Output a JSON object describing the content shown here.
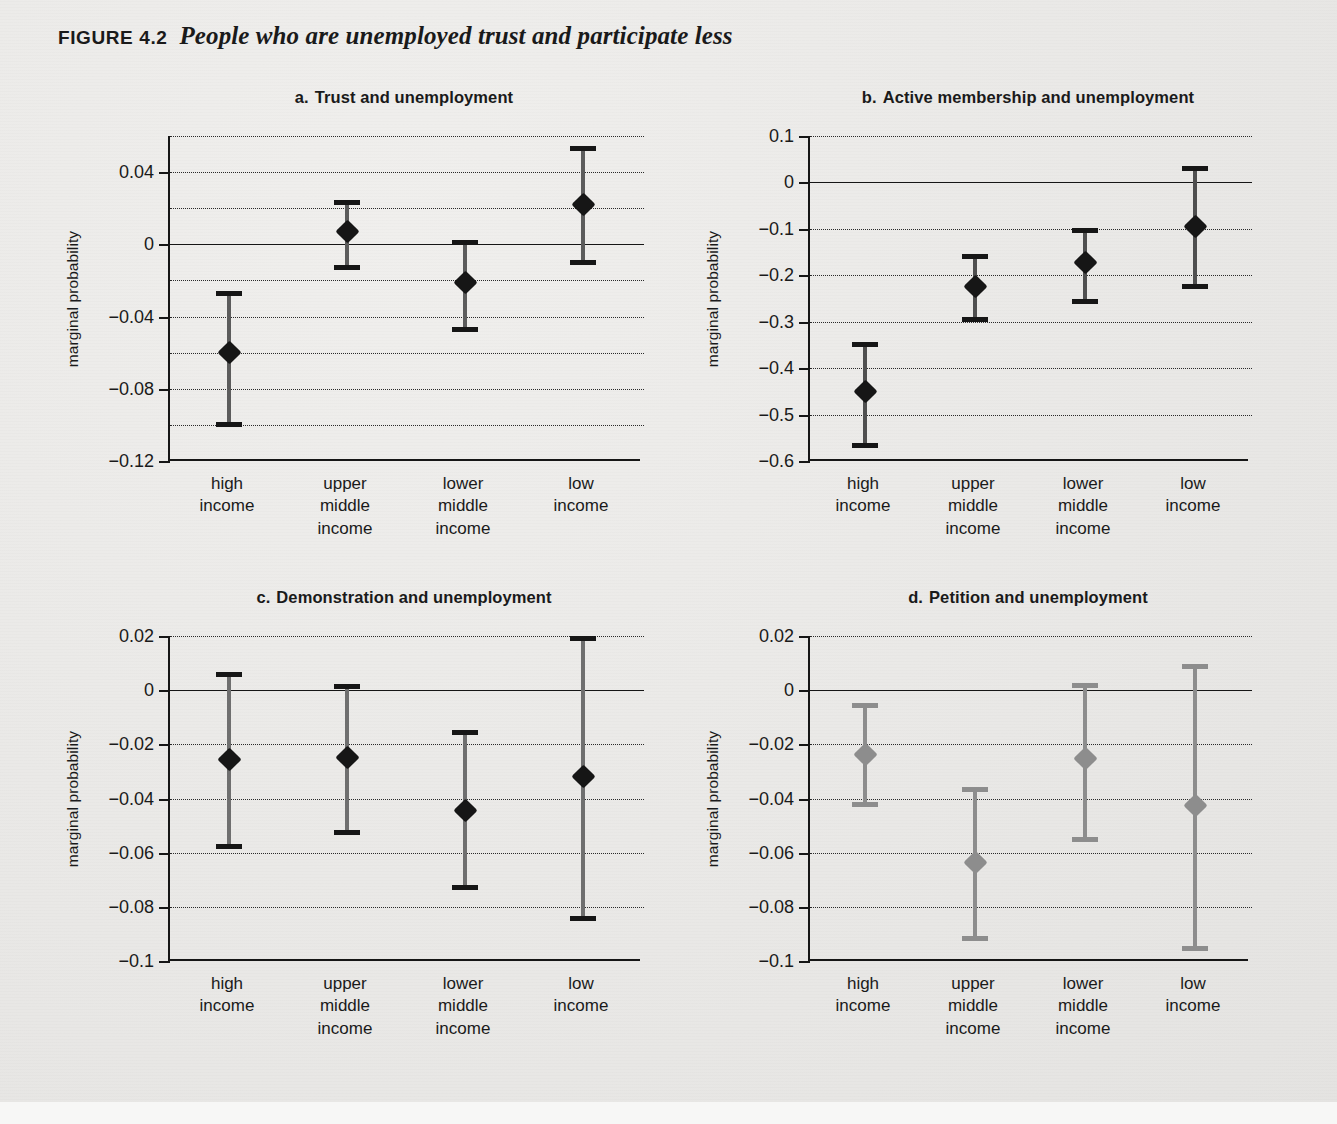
{
  "figure": {
    "label": "FIGURE 4.2",
    "title": "People who are unemployed trust and participate less"
  },
  "categories": [
    "high\nincome",
    "upper\nmiddle\nincome",
    "lower\nmiddle\nincome",
    "low\nincome"
  ],
  "category_labels": [
    [
      "high",
      "income"
    ],
    [
      "upper",
      "middle",
      "income"
    ],
    [
      "lower",
      "middle",
      "income"
    ],
    [
      "low",
      "income"
    ]
  ],
  "axis_label": "marginal probability",
  "colors": {
    "ink": "#161616",
    "panel_c_line": "#6f6f6f",
    "panel_d_line": "#8d8d8d",
    "background": "#ebebe9"
  },
  "chart_data": [
    {
      "type": "scatter",
      "panel": "a",
      "panel_letter": "a.",
      "title": "Trust and unemployment",
      "xlabel": "",
      "ylabel": "marginal probability",
      "ylim": [
        -0.12,
        0.06
      ],
      "yticks": [
        0.04,
        0,
        -0.04,
        -0.08,
        -0.12
      ],
      "ytick_labels": [
        "0.04",
        "0",
        "−0.04",
        "−0.08",
        "−0.12"
      ],
      "gridlines": [
        0.06,
        0.04,
        0.02,
        -0.02,
        -0.04,
        -0.06,
        -0.08,
        -0.1
      ],
      "grid": true,
      "zero_line": 0,
      "categories": [
        "high income",
        "upper middle income",
        "lower middle income",
        "low income"
      ],
      "values": [
        -0.06,
        0.007,
        -0.021,
        0.022
      ],
      "ci_low": [
        -0.1,
        -0.013,
        -0.047,
        -0.01
      ],
      "ci_high": [
        -0.027,
        0.023,
        0.001,
        0.053
      ],
      "marker_color": "#161616",
      "line_color": "#5c5c5c"
    },
    {
      "type": "scatter",
      "panel": "b",
      "panel_letter": "b.",
      "title": "Active membership and unemployment",
      "xlabel": "",
      "ylabel": "marginal probability",
      "ylim": [
        -0.6,
        0.1
      ],
      "yticks": [
        0.1,
        0,
        -0.1,
        -0.2,
        -0.3,
        -0.4,
        -0.5,
        -0.6
      ],
      "ytick_labels": [
        "0.1",
        "0",
        "−0.1",
        "−0.2",
        "−0.3",
        "−0.4",
        "−0.5",
        "−0.6"
      ],
      "gridlines": [
        0.1,
        -0.1,
        -0.2,
        -0.3,
        -0.4,
        -0.5
      ],
      "grid": true,
      "zero_line": 0,
      "categories": [
        "high income",
        "upper middle income",
        "lower middle income",
        "low income"
      ],
      "values": [
        -0.451,
        -0.224,
        -0.173,
        -0.095
      ],
      "ci_low": [
        -0.567,
        -0.295,
        -0.257,
        -0.224
      ],
      "ci_high": [
        -0.35,
        -0.159,
        -0.103,
        0.031
      ],
      "marker_color": "#161616",
      "line_color": "#4f4f4f"
    },
    {
      "type": "scatter",
      "panel": "c",
      "panel_letter": "c.",
      "title": "Demonstration and unemployment",
      "xlabel": "",
      "ylabel": "marginal probability",
      "ylim": [
        -0.1,
        0.02
      ],
      "yticks": [
        0.02,
        0,
        -0.02,
        -0.04,
        -0.06,
        -0.08,
        -0.1
      ],
      "ytick_labels": [
        "0.02",
        "0",
        "−0.02",
        "−0.04",
        "−0.06",
        "−0.08",
        "−0.1"
      ],
      "gridlines": [
        0.02,
        -0.02,
        -0.04,
        -0.06,
        -0.08
      ],
      "grid": true,
      "zero_line": 0,
      "categories": [
        "high income",
        "upper middle income",
        "lower middle income",
        "low income"
      ],
      "values": [
        -0.0255,
        -0.025,
        -0.0443,
        -0.032
      ],
      "ci_low": [
        -0.0578,
        -0.0525,
        -0.0727,
        -0.0843
      ],
      "ci_high": [
        0.0057,
        0.0013,
        -0.0157,
        0.019
      ],
      "marker_color": "#161616",
      "line_color": "#6f6f6f"
    },
    {
      "type": "scatter",
      "panel": "d",
      "panel_letter": "d.",
      "title": "Petition and unemployment",
      "xlabel": "",
      "ylabel": "marginal probability",
      "ylim": [
        -0.1,
        0.02
      ],
      "yticks": [
        0.02,
        0,
        -0.02,
        -0.04,
        -0.06,
        -0.08,
        -0.1
      ],
      "ytick_labels": [
        "0.02",
        "0",
        "−0.02",
        "−0.04",
        "−0.06",
        "−0.08",
        "−0.1"
      ],
      "gridlines": [
        0.02,
        -0.02,
        -0.04,
        -0.06,
        -0.08
      ],
      "grid": true,
      "zero_line": 0,
      "categories": [
        "high income",
        "upper middle income",
        "lower middle income",
        "low income"
      ],
      "values": [
        -0.0238,
        -0.0638,
        -0.0252,
        -0.0425
      ],
      "ci_low": [
        -0.0423,
        -0.0917,
        -0.055,
        -0.0955
      ],
      "ci_high": [
        -0.0057,
        -0.0368,
        0.0018,
        0.0088
      ],
      "marker_color": "#8d8d8d",
      "line_color": "#8d8d8d"
    }
  ]
}
